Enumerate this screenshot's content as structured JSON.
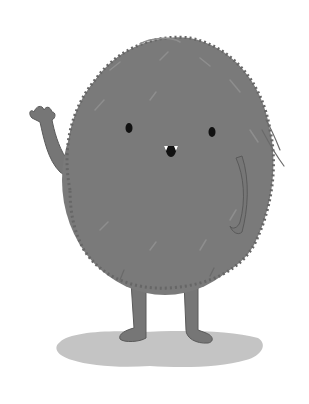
{
  "image": {
    "subject": "furry gray monster waving",
    "colors": {
      "background": "#ffffff",
      "body": "#7a7a7a",
      "body_dark": "#666666",
      "fur_light": "#8e8e8e",
      "limb": "#767676",
      "limb_outline": "#5a5a5a",
      "shadow": "#c4c4c4",
      "eye": "#111111",
      "tooth": "#ffffff"
    }
  }
}
